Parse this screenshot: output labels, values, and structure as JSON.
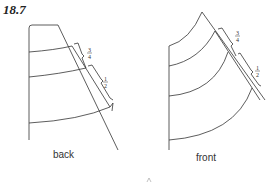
{
  "figure": {
    "number": "18.7",
    "panels": [
      {
        "name": "back",
        "label": "back",
        "measurements": [
          "3/4",
          "1/2"
        ]
      },
      {
        "name": "front",
        "label": "front",
        "measurements": [
          "3/4",
          "1/2"
        ]
      }
    ]
  },
  "fractions": {
    "three_quarters_num": "3",
    "three_quarters_den": "4",
    "half_num": "1",
    "half_den": "2"
  }
}
